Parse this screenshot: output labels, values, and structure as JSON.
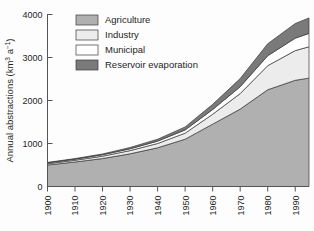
{
  "chart_data": {
    "type": "area",
    "stacked": true,
    "title": "",
    "subtitle": "",
    "xlabel": "",
    "ylabel": "Annual abstractions (km³ a⁻¹)",
    "ylabel_main": "Annual abstractions (km",
    "ylabel_sup1": "3",
    "ylabel_mid": " a",
    "ylabel_sup2": "−1",
    "ylabel_end": ")",
    "grid": false,
    "legend_position": "top-center",
    "xlim": [
      1900,
      1995
    ],
    "ylim": [
      0,
      4000
    ],
    "yticks": [
      0,
      1000,
      2000,
      3000,
      4000
    ],
    "ytick_labels": [
      "0",
      "1000",
      "2000",
      "3000",
      "4000"
    ],
    "xticks": [
      1900,
      1910,
      1920,
      1930,
      1940,
      1950,
      1960,
      1970,
      1980,
      1990
    ],
    "xtick_labels": [
      "1900",
      "1910",
      "1920",
      "1930",
      "1940",
      "1950",
      "1960",
      "1970",
      "1980",
      "1990"
    ],
    "x": [
      1900,
      1910,
      1920,
      1930,
      1940,
      1950,
      1960,
      1970,
      1980,
      1990,
      1995
    ],
    "series": [
      {
        "name": "Agriculture",
        "color": "#b0b0b0",
        "values": [
          500,
          570,
          650,
          760,
          900,
          1100,
          1450,
          1800,
          2250,
          2470,
          2520
        ]
      },
      {
        "name": "Industry",
        "color": "#ececec",
        "values": [
          30,
          40,
          55,
          75,
          100,
          140,
          230,
          360,
          560,
          690,
          730
        ]
      },
      {
        "name": "Municipal",
        "color": "#ffffff",
        "values": [
          20,
          25,
          32,
          42,
          55,
          75,
          110,
          160,
          230,
          290,
          310
        ]
      },
      {
        "name": "Reservoir evaporation",
        "color": "#7a7a7a",
        "values": [
          10,
          14,
          20,
          30,
          45,
          70,
          120,
          190,
          280,
          340,
          360
        ]
      }
    ],
    "totals": [
      560,
      649,
      757,
      907,
      1100,
      1385,
      1910,
      2510,
      3320,
      3790,
      3920
    ]
  },
  "legend": {
    "items": [
      {
        "label": "Agriculture",
        "color": "#b0b0b0"
      },
      {
        "label": "Industry",
        "color": "#ececec"
      },
      {
        "label": "Municipal",
        "color": "#ffffff"
      },
      {
        "label": "Reservoir evaporation",
        "color": "#7a7a7a"
      }
    ]
  },
  "style": {
    "axis_color": "#555555",
    "outline_color": "#3a3a3a",
    "background": "#fdfdfd"
  }
}
